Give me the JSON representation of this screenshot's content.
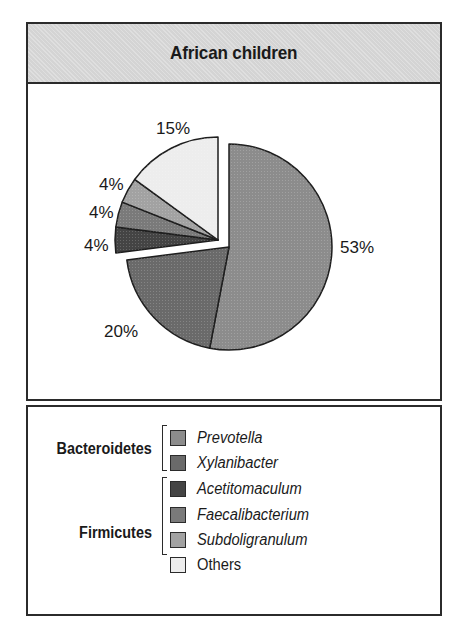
{
  "title": "African children",
  "chart_data": {
    "type": "pie",
    "title": "African children",
    "start_angle": "12 o'clock, clockwise",
    "exploded_slices": [
      "Acetitomaculum",
      "Faecalibacterium",
      "Subdoligranulum",
      "Others"
    ],
    "categories": [
      "Prevotella",
      "Xylanibacter",
      "Acetitomaculum",
      "Faecalibacterium",
      "Subdoligranulum",
      "Others"
    ],
    "values": [
      53,
      20,
      4,
      4,
      4,
      15
    ],
    "unit": "%",
    "groups": [
      {
        "name": "Bacteroidetes",
        "members": [
          "Prevotella",
          "Xylanibacter"
        ]
      },
      {
        "name": "Firmicutes",
        "members": [
          "Acetitomaculum",
          "Faecalibacterium",
          "Subdoligranulum"
        ]
      }
    ],
    "legend_position": "bottom panel"
  },
  "slices": [
    {
      "name": "Prevotella",
      "value": 53,
      "label": "53%",
      "color": "#8c8c8c"
    },
    {
      "name": "Xylanibacter",
      "value": 20,
      "label": "20%",
      "color": "#6a6a6a"
    },
    {
      "name": "Acetitomaculum",
      "value": 4,
      "label": "4%",
      "color": "#444444"
    },
    {
      "name": "Faecalibacterium",
      "value": 4,
      "label": "4%",
      "color": "#7a7a7a"
    },
    {
      "name": "Subdoligranulum",
      "value": 4,
      "label": "4%",
      "color": "#a2a2a2"
    },
    {
      "name": "Others",
      "value": 15,
      "label": "15%",
      "color": "#ededed"
    }
  ],
  "legend": {
    "groups": [
      {
        "label": "Bacteroidetes"
      },
      {
        "label": "Firmicutes"
      }
    ],
    "items": [
      {
        "label": "Prevotella",
        "color": "#8c8c8c"
      },
      {
        "label": "Xylanibacter",
        "color": "#6a6a6a"
      },
      {
        "label": "Acetitomaculum",
        "color": "#444444"
      },
      {
        "label": "Faecalibacterium",
        "color": "#7a7a7a"
      },
      {
        "label": "Subdoligranulum",
        "color": "#a2a2a2"
      },
      {
        "label": "Others",
        "color": "#ededed"
      }
    ]
  }
}
